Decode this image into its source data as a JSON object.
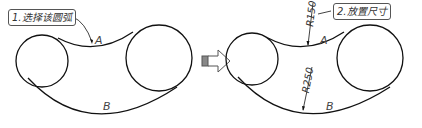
{
  "left_panel": {
    "callout": "1.选择该圆弧",
    "arc_top_label": "A",
    "arc_bottom_label": "B"
  },
  "right_panel": {
    "callout": "2.放置尺寸",
    "arc_top_label": "A",
    "arc_bottom_label": "B",
    "dimension_top": "R150",
    "dimension_bottom": "R250"
  },
  "transition_arrow": "arrow-right-icon",
  "colors": {
    "stroke": "#111111",
    "callout_border": "#555555",
    "text": "#333333"
  }
}
